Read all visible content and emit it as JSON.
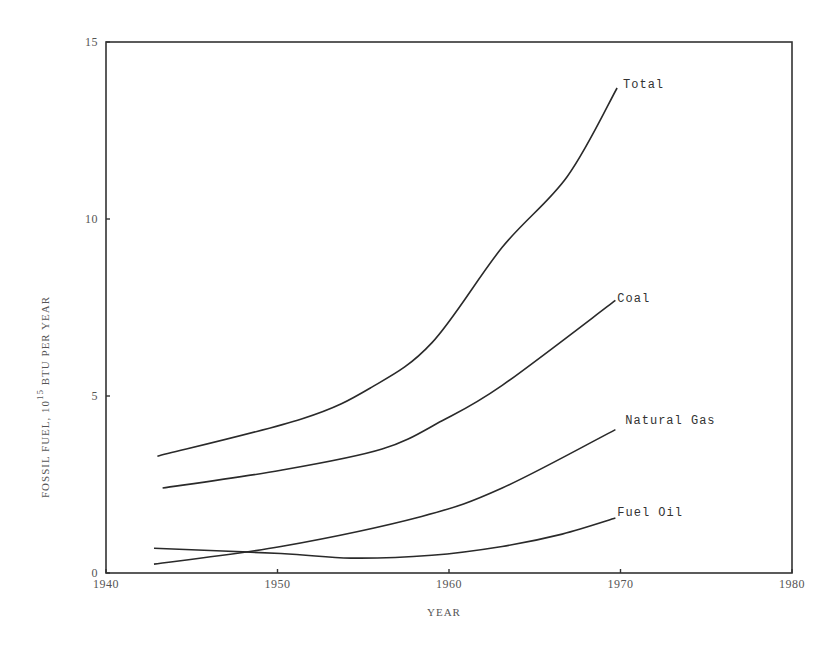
{
  "chart_data": {
    "type": "line",
    "title": "",
    "xlabel": "YEAR",
    "ylabel": "FOSSIL FUEL, 10^15 BTU PER YEAR",
    "ylabel_parts": {
      "prefix": "FOSSIL FUEL, 10",
      "exponent": "15",
      "suffix": " BTU PER YEAR"
    },
    "xlim": [
      1940,
      1980
    ],
    "ylim": [
      0,
      15
    ],
    "x_ticks": [
      1940,
      1950,
      1960,
      1970,
      1980
    ],
    "y_ticks": [
      0,
      5,
      10,
      15
    ],
    "grid": false,
    "legend": "inline labels at line ends",
    "series": [
      {
        "name": "Total",
        "x": [
          1943.0,
          1951.4,
          1955.5,
          1959.0,
          1963.1,
          1966.9,
          1969.8
        ],
        "values": [
          3.3,
          4.35,
          5.25,
          6.5,
          9.2,
          11.2,
          13.7
        ]
      },
      {
        "name": "Coal",
        "x": [
          1943.3,
          1950.2,
          1956.1,
          1959.6,
          1963.1,
          1969.7
        ],
        "values": [
          2.4,
          2.9,
          3.5,
          4.3,
          5.3,
          7.7
        ]
      },
      {
        "name": "Natural Gas",
        "x": [
          1942.8,
          1950.2,
          1958.4,
          1963.1,
          1969.7
        ],
        "values": [
          0.25,
          0.75,
          1.6,
          2.4,
          4.05
        ]
      },
      {
        "name": "Fuel Oil",
        "x": [
          1942.8,
          1950.2,
          1954.3,
          1959.0,
          1963.1,
          1966.6,
          1969.7
        ],
        "values": [
          0.7,
          0.55,
          0.42,
          0.5,
          0.75,
          1.1,
          1.55
        ]
      }
    ]
  },
  "colors": {
    "line": "#2a2a2a",
    "frame": "#333333",
    "text": "#555555",
    "background": "#ffffff"
  }
}
